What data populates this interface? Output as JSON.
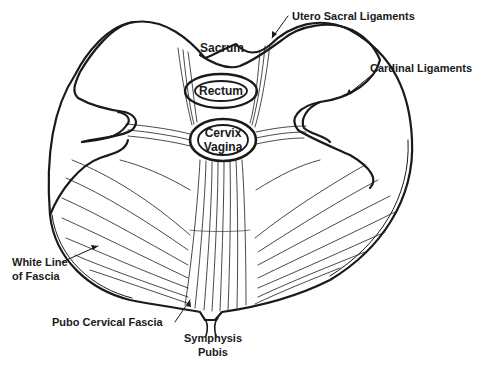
{
  "diagram": {
    "type": "anatomical-illustration",
    "colors": {
      "ink": "#1a1a1a",
      "background": "#ffffff"
    },
    "organs": {
      "sacrum": "Sacrum",
      "rectum": "Rectum",
      "cervix_line1": "Cervix",
      "cervix_line2": "Vagina"
    },
    "callouts": {
      "utero_sacral": "Utero Sacral Ligaments",
      "cardinal": "Cardinal Ligaments",
      "white_line_1": "White Line",
      "white_line_2": "of Fascia",
      "pubo_cervical": "Pubo Cervical Fascia",
      "symphysis_1": "Symphysis",
      "symphysis_2": "Pubis"
    }
  }
}
